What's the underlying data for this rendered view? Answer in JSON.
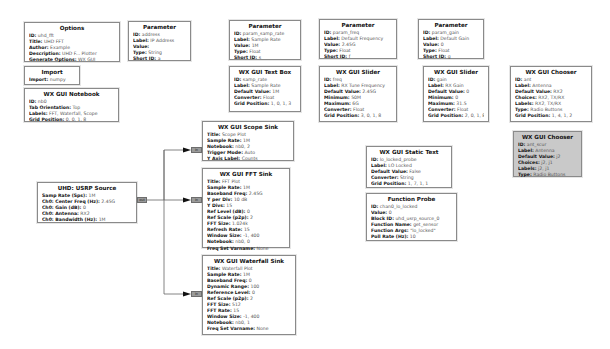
{
  "flowgraph": {
    "blocks": {
      "options": {
        "title": "Options",
        "params": [
          {
            "k": "ID:",
            "v": "uhd_fft"
          },
          {
            "k": "Title:",
            "v": "UHD FFT"
          },
          {
            "k": "Author:",
            "v": "Example"
          },
          {
            "k": "Description:",
            "v": "UHD F... Plotter"
          },
          {
            "k": "Generate Options:",
            "v": "WX GUI"
          }
        ]
      },
      "param_address": {
        "title": "Parameter",
        "params": [
          {
            "k": "ID:",
            "v": "address"
          },
          {
            "k": "Label:",
            "v": "IP Address"
          },
          {
            "k": "Value:",
            "v": ""
          },
          {
            "k": "Type:",
            "v": "String"
          },
          {
            "k": "Short ID:",
            "v": "a"
          }
        ]
      },
      "param_samp_rate": {
        "title": "Parameter",
        "params": [
          {
            "k": "ID:",
            "v": "param_samp_rate"
          },
          {
            "k": "Label:",
            "v": "Sample Rate"
          },
          {
            "k": "Value:",
            "v": "1M"
          },
          {
            "k": "Type:",
            "v": "Float"
          },
          {
            "k": "Short ID:",
            "v": "s"
          }
        ]
      },
      "param_freq": {
        "title": "Parameter",
        "params": [
          {
            "k": "ID:",
            "v": "param_freq"
          },
          {
            "k": "Label:",
            "v": "Default Frequency"
          },
          {
            "k": "Value:",
            "v": "2.45G"
          },
          {
            "k": "Type:",
            "v": "Float"
          },
          {
            "k": "Short ID:",
            "v": "f"
          }
        ]
      },
      "param_gain": {
        "title": "Parameter",
        "params": [
          {
            "k": "ID:",
            "v": "param_gain"
          },
          {
            "k": "Label:",
            "v": "Default Gain"
          },
          {
            "k": "Value:",
            "v": "0"
          },
          {
            "k": "Type:",
            "v": "Float"
          },
          {
            "k": "Short ID:",
            "v": "g"
          }
        ]
      },
      "import": {
        "title": "Import",
        "params": [
          {
            "k": "Import:",
            "v": "numpy"
          }
        ]
      },
      "notebook": {
        "title": "WX GUI Notebook",
        "params": [
          {
            "k": "ID:",
            "v": "nb0"
          },
          {
            "k": "Tab Orientation:",
            "v": "Top"
          },
          {
            "k": "Labels:",
            "v": "FFT, Waterfall, Scope"
          },
          {
            "k": "Grid Position:",
            "v": "0, 0, 1, 8"
          }
        ]
      },
      "text_box": {
        "title": "WX GUI Text Box",
        "params": [
          {
            "k": "ID:",
            "v": "samp_rate"
          },
          {
            "k": "Label:",
            "v": "Sample Rate"
          },
          {
            "k": "Default Value:",
            "v": "1M"
          },
          {
            "k": "Converter:",
            "v": "Float"
          },
          {
            "k": "Grid Position:",
            "v": "1, 0, 1, 3"
          }
        ]
      },
      "slider_freq": {
        "title": "WX GUI Slider",
        "params": [
          {
            "k": "ID:",
            "v": "freq"
          },
          {
            "k": "Label:",
            "v": "RX Tune Frequency"
          },
          {
            "k": "Default Value:",
            "v": "2.45G"
          },
          {
            "k": "Minimum:",
            "v": "50M"
          },
          {
            "k": "Maximum:",
            "v": "6G"
          },
          {
            "k": "Converter:",
            "v": "Float"
          },
          {
            "k": "Grid Position:",
            "v": "3, 0, 1, 8"
          }
        ]
      },
      "slider_gain": {
        "title": "WX GUI Slider",
        "params": [
          {
            "k": "ID:",
            "v": "gain"
          },
          {
            "k": "Label:",
            "v": "RX Gain"
          },
          {
            "k": "Default Value:",
            "v": "0"
          },
          {
            "k": "Minimum:",
            "v": "0"
          },
          {
            "k": "Maximum:",
            "v": "31.5"
          },
          {
            "k": "Converter:",
            "v": "Float"
          },
          {
            "k": "Grid Position:",
            "v": "2, 0, 1, 8"
          }
        ]
      },
      "chooser_ant": {
        "title": "WX GUI Chooser",
        "params": [
          {
            "k": "ID:",
            "v": "ant"
          },
          {
            "k": "Label:",
            "v": "Antenna"
          },
          {
            "k": "Default Value:",
            "v": "RX2"
          },
          {
            "k": "Choices:",
            "v": "RX2, TX/RX"
          },
          {
            "k": "Labels:",
            "v": "RX2, TX/RX"
          },
          {
            "k": "Type:",
            "v": "Radio Buttons"
          },
          {
            "k": "Grid Position:",
            "v": "1, 4, 1, 2"
          }
        ]
      },
      "chooser_ant_scur": {
        "title": "WX GUI Chooser",
        "params": [
          {
            "k": "ID:",
            "v": "ant_scur"
          },
          {
            "k": "Label:",
            "v": "Antenna"
          },
          {
            "k": "Default Value:",
            "v": "j2"
          },
          {
            "k": "Choices:",
            "v": "j2, j1"
          },
          {
            "k": "Labels:",
            "v": "j2, j1"
          },
          {
            "k": "Type:",
            "v": "Radio Buttons"
          }
        ]
      },
      "scope_sink": {
        "title": "WX GUI Scope Sink",
        "params": [
          {
            "k": "Title:",
            "v": "Scope Plot"
          },
          {
            "k": "Sample Rate:",
            "v": "1M"
          },
          {
            "k": "Notebook:",
            "v": "nb0, 2"
          },
          {
            "k": "Trigger Mode:",
            "v": "Auto"
          },
          {
            "k": "Y Axis Label:",
            "v": "Counts"
          }
        ],
        "port": "in"
      },
      "fft_sink": {
        "title": "WX GUI FFT Sink",
        "params": [
          {
            "k": "Title:",
            "v": "FFT Plot"
          },
          {
            "k": "Sample Rate:",
            "v": "1M"
          },
          {
            "k": "Baseband Freq:",
            "v": "2.45G"
          },
          {
            "k": "Y per Div:",
            "v": "10 dB"
          },
          {
            "k": "Y Divs:",
            "v": "15"
          },
          {
            "k": "Ref Level (dB):",
            "v": "0"
          },
          {
            "k": "Ref Scale (p2p):",
            "v": "2"
          },
          {
            "k": "FFT Size:",
            "v": "1.024k"
          },
          {
            "k": "Refresh Rate:",
            "v": "15"
          },
          {
            "k": "Window Size:",
            "v": "-1, 400"
          },
          {
            "k": "Notebook:",
            "v": "nb0, 0"
          },
          {
            "k": "Freq Set Varname:",
            "v": "None"
          }
        ],
        "port": "in"
      },
      "waterfall_sink": {
        "title": "WX GUI Waterfall Sink",
        "params": [
          {
            "k": "Title:",
            "v": "Waterfall Plot"
          },
          {
            "k": "Sample Rate:",
            "v": "1M"
          },
          {
            "k": "Baseband Freq:",
            "v": "0"
          },
          {
            "k": "Dynamic Range:",
            "v": "100"
          },
          {
            "k": "Reference Level:",
            "v": "0"
          },
          {
            "k": "Ref Scale (p2p):",
            "v": "2"
          },
          {
            "k": "FFT Size:",
            "v": "512"
          },
          {
            "k": "FFT Rate:",
            "v": "15"
          },
          {
            "k": "Window Size:",
            "v": "-1, 400"
          },
          {
            "k": "Notebook:",
            "v": "nb0, 1"
          },
          {
            "k": "Freq Set Varname:",
            "v": "None"
          }
        ],
        "port": "in"
      },
      "usrp_source": {
        "title": "UHD: USRP Source",
        "params": [
          {
            "k": "Samp Rate (Sps):",
            "v": "1M"
          },
          {
            "k": "Ch0: Center Freq (Hz):",
            "v": "2.45G"
          },
          {
            "k": "Ch0: Gain (dB):",
            "v": "0"
          },
          {
            "k": "Ch0: Antenna:",
            "v": "RX2"
          },
          {
            "k": "Ch0: Bandwidth (Hz):",
            "v": "1M"
          }
        ],
        "port": "out"
      },
      "static_text": {
        "title": "WX GUI Static Text",
        "params": [
          {
            "k": "ID:",
            "v": "lo_locked_probe"
          },
          {
            "k": "Label:",
            "v": "LO Locked"
          },
          {
            "k": "Default Value:",
            "v": "False"
          },
          {
            "k": "Converter:",
            "v": "String"
          },
          {
            "k": "Grid Position:",
            "v": "1, 7, 1, 1"
          }
        ]
      },
      "function_probe": {
        "title": "Function Probe",
        "params": [
          {
            "k": "ID:",
            "v": "chan0_lo_locked"
          },
          {
            "k": "Value:",
            "v": "0"
          },
          {
            "k": "Block ID:",
            "v": "uhd_usrp_source_0"
          },
          {
            "k": "Function Name:",
            "v": "get_sensor"
          },
          {
            "k": "Function Args:",
            "v": "\"lo_locked\""
          },
          {
            "k": "Poll Rate (Hz):",
            "v": "10"
          }
        ]
      }
    },
    "colors": {
      "block_border": "#8a8a8a",
      "block_bg": "#ffffff",
      "disabled_block_bg": "#c9c9c9",
      "port_bg": "#9a9a9a",
      "wire": "#555555"
    }
  }
}
